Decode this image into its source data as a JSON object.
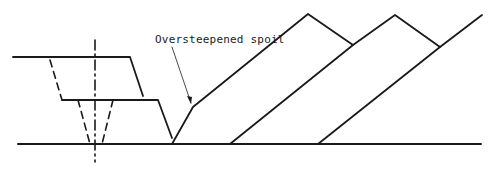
{
  "diagram": {
    "type": "cross-section",
    "labels": {
      "spoil_annotation": "Oversteepened spoil"
    },
    "colors": {
      "stroke": "#1a1a1a",
      "background": "#ffffff"
    }
  }
}
